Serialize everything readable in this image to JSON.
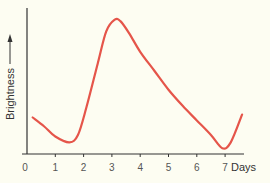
{
  "chart_data": {
    "type": "line",
    "title": "",
    "xlabel": "Days",
    "ylabel": "Brightness",
    "xlim": [
      0,
      7.7
    ],
    "ylim": [
      0,
      10
    ],
    "x_ticks": [
      "0",
      "1",
      "2",
      "3",
      "4",
      "5",
      "6",
      "7"
    ],
    "y_ticks": [],
    "grid": false,
    "legend": "none",
    "series": [
      {
        "name": "Brightness",
        "color": "#e5554a",
        "x": [
          0.2,
          0.6,
          1.0,
          1.5,
          1.8,
          2.1,
          2.5,
          2.8,
          3.1,
          3.3,
          3.6,
          4.0,
          4.5,
          5.0,
          5.5,
          6.0,
          6.5,
          6.9,
          7.2,
          7.6
        ],
        "y": [
          2.5,
          1.9,
          1.2,
          0.8,
          1.3,
          3.2,
          6.2,
          8.4,
          9.2,
          9.1,
          8.3,
          7.0,
          5.7,
          4.4,
          3.3,
          2.3,
          1.3,
          0.4,
          0.8,
          2.7
        ]
      }
    ]
  }
}
